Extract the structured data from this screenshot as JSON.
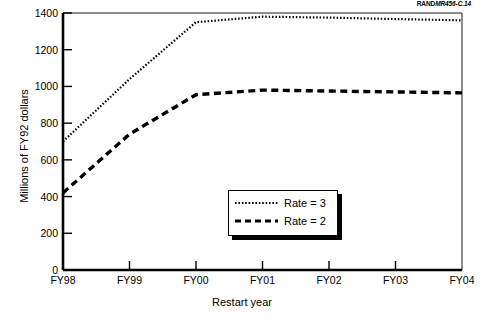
{
  "source_credit": {
    "bold_part": "RAND",
    "italic_part": "MR456-C.14"
  },
  "legend": {
    "position": "inside-center-lower",
    "entries": [
      {
        "label": "Rate = 3",
        "style": "dotted",
        "color": "#000000"
      },
      {
        "label": "Rate = 2",
        "style": "dashed",
        "color": "#000000"
      }
    ]
  },
  "chart_data": {
    "type": "line",
    "title": "",
    "subtitle": "",
    "xlabel": "Restart year",
    "ylabel": "Millions of FY92 dollars",
    "x": [
      "FY98",
      "FY99",
      "FY00",
      "FY01",
      "FY02",
      "FY03",
      "FY04"
    ],
    "xtick_labels": [
      "FY98",
      "FY99",
      "FY00",
      "FY01",
      "FY02",
      "FY03",
      "FY04"
    ],
    "ytick_labels": [
      "0",
      "200",
      "400",
      "600",
      "800",
      "1000",
      "1200",
      "1400"
    ],
    "ytick_values": [
      0,
      200,
      400,
      600,
      800,
      1000,
      1200,
      1400
    ],
    "ylim": [
      0,
      1400
    ],
    "xlim": [
      0,
      6
    ],
    "grid": false,
    "legend_position": "center",
    "series": [
      {
        "name": "Rate = 3",
        "style": "dotted",
        "color": "#000000",
        "values": [
          700,
          1040,
          1350,
          1380,
          1375,
          1367,
          1360
        ]
      },
      {
        "name": "Rate = 2",
        "style": "dashed",
        "color": "#000000",
        "values": [
          420,
          740,
          955,
          980,
          975,
          970,
          965
        ]
      }
    ],
    "annotations": []
  }
}
